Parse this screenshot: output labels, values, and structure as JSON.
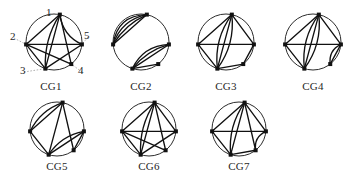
{
  "figure": {
    "background_color": "#ffffff",
    "ink_color": "#111111",
    "rim_color": "#2b2b2b",
    "leader_color": "#8d8d8d",
    "vertex_count_per_graph": 5,
    "vertex_labels": [
      "1",
      "2",
      "3",
      "4",
      "5"
    ],
    "rows": [
      {
        "captions": [
          "CG1",
          "CG2",
          "CG3",
          "CG4"
        ]
      },
      {
        "captions": [
          "CG5",
          "CG6",
          "CG7"
        ]
      }
    ],
    "graphs": [
      {
        "id": "CG1",
        "caption": "CG1",
        "labeled": true,
        "labels": [
          {
            "text": "1",
            "x": 38,
            "y": 1,
            "anchor_vertex": 0
          },
          {
            "text": "2",
            "x": 2,
            "y": 25,
            "anchor_vertex": 1
          },
          {
            "text": "3",
            "x": 12,
            "y": 59,
            "anchor_vertex": 2
          },
          {
            "text": "4",
            "x": 70,
            "y": 59,
            "anchor_vertex": 3
          },
          {
            "text": "5",
            "x": 76,
            "y": 24,
            "anchor_vertex": 4
          }
        ],
        "edges": [
          {
            "from": 0,
            "to": 1,
            "bow": 0
          },
          {
            "from": 0,
            "to": 2,
            "bow": 0
          },
          {
            "from": 0,
            "to": 2,
            "bow": 9
          },
          {
            "from": 0,
            "to": 3,
            "bow": 0
          },
          {
            "from": 0,
            "to": 4,
            "bow": 10
          },
          {
            "from": 1,
            "to": 2,
            "bow": 0
          },
          {
            "from": 1,
            "to": 3,
            "bow": 0
          },
          {
            "from": 1,
            "to": 4,
            "bow": 0
          },
          {
            "from": 2,
            "to": 4,
            "bow": 0
          }
        ]
      },
      {
        "id": "CG2",
        "caption": "CG2",
        "labeled": false,
        "edges": [
          {
            "from": 0,
            "to": 1,
            "bow": 0
          },
          {
            "from": 0,
            "to": 1,
            "bow": 7
          },
          {
            "from": 0,
            "to": 1,
            "bow": 13
          },
          {
            "from": 0,
            "to": 1,
            "bow": 19
          },
          {
            "from": 2,
            "to": 4,
            "bow": 0
          },
          {
            "from": 2,
            "to": 4,
            "bow": -7
          },
          {
            "from": 2,
            "to": 4,
            "bow": -13
          },
          {
            "from": 2,
            "to": 3,
            "bow": 0
          }
        ]
      },
      {
        "id": "CG3",
        "caption": "CG3",
        "labeled": false,
        "edges": [
          {
            "from": 0,
            "to": 1,
            "bow": 0
          },
          {
            "from": 0,
            "to": 2,
            "bow": 0
          },
          {
            "from": 0,
            "to": 2,
            "bow": 11
          },
          {
            "from": 0,
            "to": 2,
            "bow": -11
          },
          {
            "from": 0,
            "to": 4,
            "bow": 0
          },
          {
            "from": 1,
            "to": 2,
            "bow": 0
          },
          {
            "from": 1,
            "to": 4,
            "bow": 0
          },
          {
            "from": 2,
            "to": 3,
            "bow": 0
          },
          {
            "from": 3,
            "to": 4,
            "bow": 0
          }
        ]
      },
      {
        "id": "CG4",
        "caption": "CG4",
        "labeled": false,
        "edges": [
          {
            "from": 0,
            "to": 1,
            "bow": 0
          },
          {
            "from": 0,
            "to": 2,
            "bow": 0
          },
          {
            "from": 0,
            "to": 2,
            "bow": 11
          },
          {
            "from": 0,
            "to": 2,
            "bow": -11
          },
          {
            "from": 0,
            "to": 4,
            "bow": 0
          },
          {
            "from": 1,
            "to": 2,
            "bow": 0
          },
          {
            "from": 1,
            "to": 4,
            "bow": 0
          },
          {
            "from": 3,
            "to": 4,
            "bow": 0
          },
          {
            "from": 3,
            "to": 4,
            "bow": -8
          }
        ]
      },
      {
        "id": "CG5",
        "caption": "CG5",
        "labeled": false,
        "edges": [
          {
            "from": 0,
            "to": 1,
            "bow": 0
          },
          {
            "from": 0,
            "to": 1,
            "bow": 9
          },
          {
            "from": 0,
            "to": 2,
            "bow": 0
          },
          {
            "from": 0,
            "to": 3,
            "bow": 0
          },
          {
            "from": 1,
            "to": 2,
            "bow": 0
          },
          {
            "from": 2,
            "to": 4,
            "bow": 0
          },
          {
            "from": 2,
            "to": 4,
            "bow": -9
          },
          {
            "from": 3,
            "to": 4,
            "bow": 0
          }
        ]
      },
      {
        "id": "CG6",
        "caption": "CG6",
        "labeled": false,
        "edges": [
          {
            "from": 0,
            "to": 1,
            "bow": 0
          },
          {
            "from": 0,
            "to": 2,
            "bow": 0
          },
          {
            "from": 0,
            "to": 2,
            "bow": 9
          },
          {
            "from": 0,
            "to": 3,
            "bow": 0
          },
          {
            "from": 0,
            "to": 4,
            "bow": 0
          },
          {
            "from": 1,
            "to": 2,
            "bow": 0
          },
          {
            "from": 1,
            "to": 3,
            "bow": 0
          },
          {
            "from": 1,
            "to": 4,
            "bow": 0
          },
          {
            "from": 2,
            "to": 4,
            "bow": 0
          }
        ]
      },
      {
        "id": "CG7",
        "caption": "CG7",
        "labeled": false,
        "edges": [
          {
            "from": 0,
            "to": 1,
            "bow": 0
          },
          {
            "from": 0,
            "to": 2,
            "bow": 0
          },
          {
            "from": 0,
            "to": 2,
            "bow": 10
          },
          {
            "from": 0,
            "to": 3,
            "bow": 0
          },
          {
            "from": 0,
            "to": 4,
            "bow": 0
          },
          {
            "from": 1,
            "to": 2,
            "bow": 0
          },
          {
            "from": 1,
            "to": 4,
            "bow": 0
          },
          {
            "from": 2,
            "to": 3,
            "bow": 0
          },
          {
            "from": 3,
            "to": 4,
            "bow": -8
          }
        ]
      }
    ],
    "layout": {
      "cells": [
        {
          "id": "CG1",
          "left": 8,
          "top": 6,
          "w": 86,
          "h": 72,
          "cx": 46,
          "cy": 36,
          "r": 28
        },
        {
          "id": "CG2",
          "left": 102,
          "top": 6,
          "w": 78,
          "h": 72,
          "cx": 39,
          "cy": 36,
          "r": 28
        },
        {
          "id": "CG3",
          "left": 187,
          "top": 6,
          "w": 78,
          "h": 72,
          "cx": 39,
          "cy": 36,
          "r": 28
        },
        {
          "id": "CG4",
          "left": 274,
          "top": 6,
          "w": 78,
          "h": 72,
          "cx": 39,
          "cy": 36,
          "r": 28
        },
        {
          "id": "CG5",
          "left": 18,
          "top": 98,
          "w": 78,
          "h": 62,
          "cx": 39,
          "cy": 31,
          "r": 27
        },
        {
          "id": "CG6",
          "left": 110,
          "top": 98,
          "w": 78,
          "h": 62,
          "cx": 39,
          "cy": 31,
          "r": 27
        },
        {
          "id": "CG7",
          "left": 200,
          "top": 98,
          "w": 78,
          "h": 62,
          "cx": 39,
          "cy": 31,
          "r": 27
        }
      ],
      "captions": [
        {
          "id": "CG1",
          "left": 8,
          "top": 80,
          "w": 86
        },
        {
          "id": "CG2",
          "left": 102,
          "top": 80,
          "w": 78
        },
        {
          "id": "CG3",
          "left": 187,
          "top": 80,
          "w": 78
        },
        {
          "id": "CG4",
          "left": 274,
          "top": 80,
          "w": 78
        },
        {
          "id": "CG5",
          "left": 18,
          "top": 160,
          "w": 78
        },
        {
          "id": "CG6",
          "left": 110,
          "top": 160,
          "w": 78
        },
        {
          "id": "CG7",
          "left": 200,
          "top": 160,
          "w": 78
        }
      ],
      "vertex_angles_deg": [
        -78,
        175,
        108,
        52,
        5
      ]
    }
  }
}
